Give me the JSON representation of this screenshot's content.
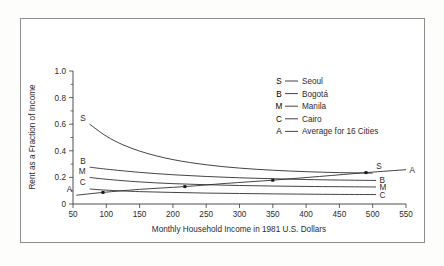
{
  "figure": {
    "background_color": "#ffffff",
    "frame_color": "#8d8d8d",
    "line_color": "#2f2f2f"
  },
  "chart_data": {
    "type": "line",
    "title": "",
    "xlabel": "Monthly Household Income in 1981 U.S. Dollars",
    "ylabel": "Rent as a Fraction of Income",
    "xlim": [
      50,
      550
    ],
    "ylim": [
      0,
      1.0
    ],
    "xticks": [
      50,
      100,
      150,
      200,
      250,
      300,
      350,
      400,
      450,
      500,
      550
    ],
    "xticklabels": [
      "50",
      "100",
      "150",
      "200",
      "250",
      "300",
      "350",
      "400",
      "450",
      "500",
      "550"
    ],
    "yticks": [
      0,
      0.2,
      0.4,
      0.6,
      0.8,
      1.0
    ],
    "yticklabels": [
      "0",
      "0.2",
      "0.4",
      "0.6",
      "0.8",
      "1.0"
    ],
    "yminor_ticks": [
      0.1,
      0.3,
      0.5,
      0.7,
      0.9
    ],
    "grid": false,
    "legend_position": "upper right",
    "legend": [
      {
        "key": "S",
        "label": "Seoul"
      },
      {
        "key": "B",
        "label": "Bogotá"
      },
      {
        "key": "M",
        "label": "Manila"
      },
      {
        "key": "C",
        "label": "Cairo"
      },
      {
        "key": "A",
        "label": "Average for 16 Cities"
      }
    ],
    "series": [
      {
        "name": "Seoul",
        "key": "S",
        "label_left": "S",
        "label_right": "S",
        "points": [
          [
            75,
            0.6
          ],
          [
            100,
            0.51
          ],
          [
            125,
            0.445
          ],
          [
            150,
            0.398
          ],
          [
            175,
            0.362
          ],
          [
            200,
            0.334
          ],
          [
            225,
            0.312
          ],
          [
            250,
            0.295
          ],
          [
            275,
            0.281
          ],
          [
            300,
            0.27
          ],
          [
            325,
            0.261
          ],
          [
            350,
            0.254
          ],
          [
            375,
            0.248
          ],
          [
            400,
            0.243
          ],
          [
            425,
            0.239
          ],
          [
            450,
            0.236
          ],
          [
            475,
            0.234
          ],
          [
            500,
            0.232
          ]
        ]
      },
      {
        "name": "Bogotá",
        "key": "B",
        "label_left": "B",
        "label_right": "B",
        "points": [
          [
            75,
            0.277
          ],
          [
            100,
            0.262
          ],
          [
            150,
            0.238
          ],
          [
            200,
            0.22
          ],
          [
            250,
            0.207
          ],
          [
            300,
            0.197
          ],
          [
            350,
            0.19
          ],
          [
            400,
            0.184
          ],
          [
            450,
            0.18
          ],
          [
            505,
            0.177
          ]
        ]
      },
      {
        "name": "Manila",
        "key": "M",
        "label_left": "M",
        "label_right": "M",
        "points": [
          [
            75,
            0.2
          ],
          [
            100,
            0.186
          ],
          [
            150,
            0.166
          ],
          [
            200,
            0.153
          ],
          [
            250,
            0.145
          ],
          [
            300,
            0.139
          ],
          [
            350,
            0.135
          ],
          [
            400,
            0.132
          ],
          [
            450,
            0.13
          ],
          [
            505,
            0.128
          ]
        ]
      },
      {
        "name": "Cairo",
        "key": "C",
        "label_left": "C",
        "label_right": "C",
        "points": [
          [
            75,
            0.113
          ],
          [
            100,
            0.104
          ],
          [
            150,
            0.093
          ],
          [
            200,
            0.087
          ],
          [
            250,
            0.082
          ],
          [
            300,
            0.079
          ],
          [
            350,
            0.076
          ],
          [
            400,
            0.074
          ],
          [
            450,
            0.072
          ],
          [
            505,
            0.071
          ]
        ]
      },
      {
        "name": "Average for 16 Cities",
        "key": "A",
        "label_left": "A",
        "label_right": "A",
        "points": [
          [
            55,
            0.066
          ],
          [
            95,
            0.087
          ],
          [
            150,
            0.11
          ],
          [
            218,
            0.131
          ],
          [
            280,
            0.155
          ],
          [
            350,
            0.179
          ],
          [
            420,
            0.207
          ],
          [
            490,
            0.236
          ],
          [
            550,
            0.258
          ]
        ],
        "markers": [
          [
            95,
            0.087
          ],
          [
            218,
            0.131
          ],
          [
            350,
            0.179
          ],
          [
            490,
            0.236
          ]
        ]
      }
    ]
  }
}
